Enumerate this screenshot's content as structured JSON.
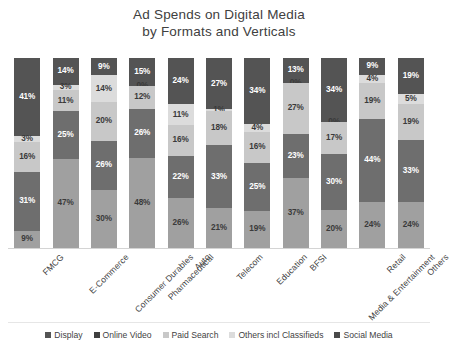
{
  "title": {
    "line1": "Ad Spends on Digital Media",
    "line2": "by Formats and Verticals"
  },
  "legend": {
    "items": [
      {
        "label": "Display",
        "color": "#545454"
      },
      {
        "label": "Online Video",
        "color": "#3f3f3f"
      },
      {
        "label": "Paid Search",
        "color": "#c8c8c8"
      },
      {
        "label": "Others incl Classifieds",
        "color": "#dcdcdc"
      },
      {
        "label": "Social Media",
        "color": "#4a4a4a"
      }
    ]
  },
  "chart_data": {
    "type": "bar",
    "subtype": "stacked-100-percent",
    "title": "Ad Spends on Digital Media by Formats and Verticals",
    "xlabel": "",
    "ylabel": "",
    "ylim": [
      0,
      100
    ],
    "grid": false,
    "legend_position": "bottom",
    "value_suffix": "%",
    "stack_order_top_to_bottom": [
      "Display",
      "Online Video",
      "Paid Search",
      "Others incl Classifieds",
      "Social Media"
    ],
    "categories": [
      "FMCG",
      "E-Commerce",
      "Consumer Durables",
      "Pharmaceutical",
      "Auto",
      "Telecom",
      "Education",
      "BFSI",
      "Media & Entertainment",
      "Retail",
      "Others"
    ],
    "series": [
      {
        "name": "Display",
        "color": "#545454",
        "values": [
          41,
          14,
          9,
          15,
          24,
          27,
          34,
          13,
          34,
          9,
          19
        ]
      },
      {
        "name": "Online Video",
        "color": "#dcdcdc",
        "values": [
          3,
          3,
          14,
          0,
          11,
          1,
          4,
          0,
          0,
          4,
          5
        ]
      },
      {
        "name": "Paid Search",
        "color": "#c8c8c8",
        "values": [
          16,
          11,
          20,
          12,
          16,
          18,
          16,
          27,
          17,
          19,
          19
        ]
      },
      {
        "name": "Others incl Classifieds",
        "color": "#6e6e6e",
        "values": [
          31,
          25,
          26,
          26,
          22,
          33,
          25,
          23,
          30,
          44,
          33
        ]
      },
      {
        "name": "Social Media",
        "color": "#a0a0a0",
        "values": [
          9,
          47,
          30,
          48,
          26,
          21,
          19,
          37,
          20,
          24,
          24
        ]
      }
    ]
  }
}
